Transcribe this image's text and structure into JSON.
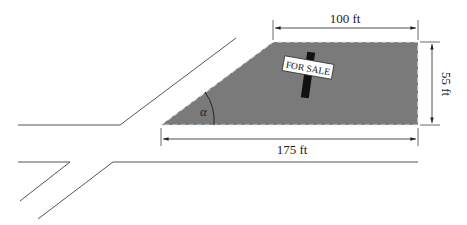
{
  "diagram": {
    "type": "land-lot-trapezoid",
    "sign_text": "FOR SALE",
    "angle_label": "α",
    "dimensions": {
      "top": "100 ft",
      "right": "55 ft",
      "bottom": "175 ft"
    },
    "colors": {
      "lot_fill": "#7a7a7a",
      "lot_border": "#555555",
      "road_lines": "#555555",
      "sign_post": "#111111",
      "sign_face": "#ffffff"
    }
  }
}
